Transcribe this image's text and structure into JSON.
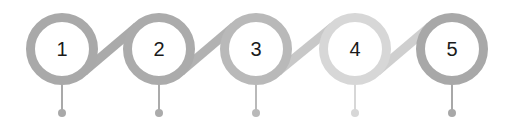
{
  "diagram": {
    "type": "numbered-step-timeline",
    "steps": [
      {
        "label": "1",
        "cx": 62,
        "color": "#a9a9a9"
      },
      {
        "label": "2",
        "cx": 159,
        "color": "#ababab"
      },
      {
        "label": "3",
        "cx": 256,
        "color": "#b9b9b9"
      },
      {
        "label": "4",
        "cx": 355,
        "color": "#d7d7d7"
      },
      {
        "label": "5",
        "cx": 452,
        "color": "#a8a8a8"
      }
    ],
    "connectors": [
      {
        "from": "1",
        "to": "2",
        "color": "#aaaaaa"
      },
      {
        "from": "2",
        "to": "3",
        "color": "#b2b2b2"
      },
      {
        "from": "3",
        "to": "4",
        "color": "#c8c8c8"
      },
      {
        "from": "4",
        "to": "5",
        "color": "#cfcfcf"
      }
    ],
    "geometry": {
      "cy": 49,
      "outer_r": 36,
      "ring_w": 9,
      "stem_end": 113,
      "dot_r": 4
    }
  }
}
